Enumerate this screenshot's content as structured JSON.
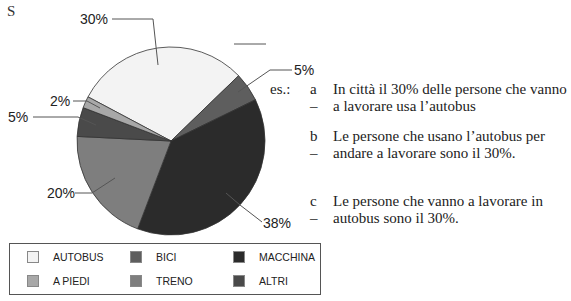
{
  "corner_letter": "S",
  "chart_data": {
    "type": "pie",
    "title": "",
    "slices": [
      {
        "label": "AUTOBUS",
        "value": 30,
        "display": "30%",
        "color": "#f3f3f3"
      },
      {
        "label": "BICI",
        "value": 5,
        "display": "5%",
        "color": "#5e5e5e"
      },
      {
        "label": "MACCHINA",
        "value": 38,
        "display": "38%",
        "color": "#2b2b2b"
      },
      {
        "label": "TRENO",
        "value": 20,
        "display": "20%",
        "color": "#7e7e7e"
      },
      {
        "label": "ALTRI",
        "value": 5,
        "display": "5%",
        "color": "#4a4a4a"
      },
      {
        "label": "A PIEDI",
        "value": 2,
        "display": "2%",
        "color": "#a8a8a8"
      }
    ],
    "legend_position": "bottom"
  },
  "labels": {
    "autobus": "30%",
    "bici": "5%",
    "macchina": "38%",
    "treno": "20%",
    "altri": "5%",
    "piedi": "2%"
  },
  "examples": {
    "prefix": "es.:",
    "items": [
      {
        "letter": "a –",
        "text": "In città il 30% delle persone che vanno a lavorare usa l’autobus"
      },
      {
        "letter": "b –",
        "text": "Le persone che usano l’autobus per andare a lavorare sono il 30%."
      },
      {
        "letter": "c –",
        "text": "Le persone che vanno a lavorare in autobus sono il 30%."
      }
    ]
  },
  "legend": [
    {
      "label": "AUTOBUS",
      "color": "#f3f3f3"
    },
    {
      "label": "BICI",
      "color": "#5e5e5e"
    },
    {
      "label": "MACCHINA",
      "color": "#2b2b2b"
    },
    {
      "label": "A PIEDI",
      "color": "#a8a8a8"
    },
    {
      "label": "TRENO",
      "color": "#7e7e7e"
    },
    {
      "label": "ALTRI",
      "color": "#4a4a4a"
    }
  ]
}
